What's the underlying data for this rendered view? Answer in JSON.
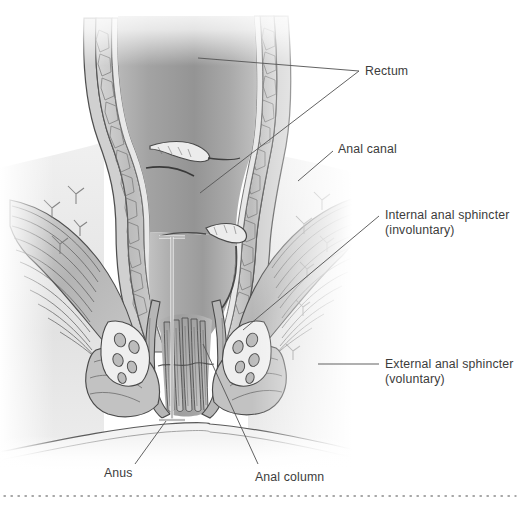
{
  "figure": {
    "background_color": "#ffffff",
    "label_color": "#3c3c3c",
    "leader_color": "#5a5a5a",
    "divider": {
      "name": "dotted-divider",
      "style": "dotted",
      "color": "#8a8a8a",
      "y": 496
    },
    "illustration": {
      "type": "medical-anatomical-cross-section",
      "palette": {
        "lumen_dark": "#8f8f8f",
        "lumen_mid": "#a6a6a6",
        "lumen_light": "#c4c4c4",
        "wall_mid": "#b0b0b0",
        "wall_light": "#d8d8d8",
        "tissue_pale": "#e4e4e4",
        "tissue_white": "#f2f2f2",
        "outline": "#4a4a4a",
        "outline_soft": "#6e6e6e",
        "muscle_band": "#bdbdbd",
        "vessel_fill": "#cfcfcf"
      },
      "structures": [
        "rectal wall",
        "rectal lumen",
        "mucosal folds",
        "levator ani muscle fibers",
        "internal anal sphincter",
        "external anal sphincter",
        "anal columns",
        "hemorrhoidal vascular cushions",
        "anal verge"
      ]
    },
    "bracket": {
      "name": "anal-canal-extent-bracket",
      "x": 172,
      "top_y": 237,
      "bottom_y": 420,
      "arm_half_width": 13,
      "color": "#efefef",
      "edge_color": "#707070"
    },
    "labels": [
      {
        "id": "rectum",
        "name": "label-rectum",
        "line1": "Rectum",
        "line2": "",
        "x": 365,
        "y": 64,
        "leaders": [
          {
            "x1": 359,
            "y1": 71,
            "x2": 198,
            "y2": 58
          },
          {
            "x1": 359,
            "y1": 71,
            "x2": 200,
            "y2": 193
          }
        ]
      },
      {
        "id": "anal-canal",
        "name": "label-anal-canal",
        "line1": "Anal canal",
        "line2": "",
        "x": 338,
        "y": 142,
        "leaders": [
          {
            "x1": 333,
            "y1": 151,
            "x2": 298,
            "y2": 181
          }
        ]
      },
      {
        "id": "internal-anal-sphincter",
        "name": "label-internal-anal-sphincter",
        "line1": "Internal anal sphincter",
        "line2": "(involuntary)",
        "x": 385,
        "y": 208,
        "leaders": [
          {
            "x1": 379,
            "y1": 216,
            "x2": 243,
            "y2": 330
          }
        ]
      },
      {
        "id": "external-anal-sphincter",
        "name": "label-external-anal-sphincter",
        "line1": "External anal sphincter",
        "line2": "(voluntary)",
        "x": 385,
        "y": 357,
        "leaders": [
          {
            "x1": 379,
            "y1": 364,
            "x2": 318,
            "y2": 364
          }
        ]
      },
      {
        "id": "anus",
        "name": "label-anus",
        "line1": "Anus",
        "line2": "",
        "x": 104,
        "y": 466,
        "leaders": [
          {
            "x1": 135,
            "y1": 464,
            "x2": 166,
            "y2": 421
          }
        ]
      },
      {
        "id": "anal-column",
        "name": "label-anal-column",
        "line1": "Anal column",
        "line2": "",
        "x": 255,
        "y": 470,
        "leaders": [
          {
            "x1": 258,
            "y1": 464,
            "x2": 203,
            "y2": 344
          }
        ]
      }
    ]
  }
}
